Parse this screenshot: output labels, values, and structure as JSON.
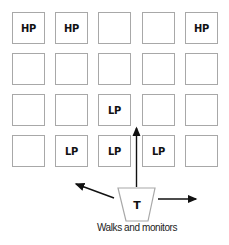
{
  "grid": {
    "rows": 4,
    "cols": 5,
    "cells": [
      [
        "HP",
        "HP",
        "",
        "",
        "HP"
      ],
      [
        "",
        "",
        "",
        "",
        ""
      ],
      [
        "",
        "",
        "LP",
        "",
        ""
      ],
      [
        "",
        "LP",
        "LP",
        "LP",
        ""
      ]
    ],
    "col_x": [
      12,
      55,
      98,
      142,
      185
    ],
    "row_y": [
      12,
      53,
      94,
      135
    ]
  },
  "teacher": {
    "label": "T",
    "caption": "Walks and monitors"
  },
  "arrows": [
    "left",
    "up",
    "right"
  ],
  "colors": {
    "cell_border": "#a8a8a8",
    "arrow": "#111111",
    "trapezoid_border": "#a8a8a8"
  }
}
